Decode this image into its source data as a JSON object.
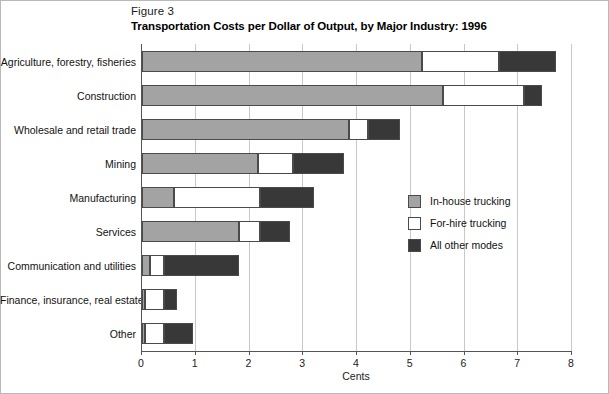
{
  "figure": {
    "number": "Figure 3",
    "title": "Transportation Costs per Dollar of Output, by Major Industry: 1996"
  },
  "legend": {
    "position": "inside-right",
    "items": [
      {
        "label": "In-house trucking",
        "color": "#a3a3a3",
        "key": "in_house_trucking"
      },
      {
        "label": "For-hire trucking",
        "color": "#ffffff",
        "key": "for_hire_trucking"
      },
      {
        "label": "All other modes",
        "color": "#383838",
        "key": "all_other_modes"
      }
    ]
  },
  "axis": {
    "x_title": "Cents",
    "x_ticks": [
      "0",
      "1",
      "2",
      "3",
      "4",
      "5",
      "6",
      "7",
      "8"
    ]
  },
  "chart_data": {
    "type": "bar",
    "orientation": "horizontal",
    "stacked": true,
    "title": "Transportation Costs per Dollar of Output, by Major Industry: 1996",
    "subtitle": "Figure 3",
    "xlabel": "Cents",
    "ylabel": "",
    "xlim": [
      0,
      8
    ],
    "xticks": [
      0,
      1,
      2,
      3,
      4,
      5,
      6,
      7,
      8
    ],
    "grid": "vertical",
    "legend_position": "inside-right",
    "categories": [
      "Agriculture, forestry, fisheries",
      "Construction",
      "Wholesale and retail trade",
      "Mining",
      "Manufacturing",
      "Services",
      "Communication and utilities",
      "Finance, insurance, real estate",
      "Other"
    ],
    "series": [
      {
        "name": "In-house trucking",
        "color": "#a3a3a3",
        "values": [
          5.2,
          5.6,
          3.85,
          2.15,
          0.6,
          1.8,
          0.15,
          0.05,
          0.05
        ]
      },
      {
        "name": "For-hire trucking",
        "color": "#ffffff",
        "values": [
          1.45,
          1.5,
          0.35,
          0.65,
          1.6,
          0.4,
          0.25,
          0.35,
          0.35
        ]
      },
      {
        "name": "All other modes",
        "color": "#383838",
        "values": [
          1.05,
          0.35,
          0.6,
          0.95,
          1.0,
          0.55,
          1.4,
          0.25,
          0.55
        ]
      }
    ],
    "totals": [
      7.7,
      7.45,
      4.8,
      3.75,
      3.2,
      2.75,
      1.8,
      0.65,
      0.95
    ]
  }
}
